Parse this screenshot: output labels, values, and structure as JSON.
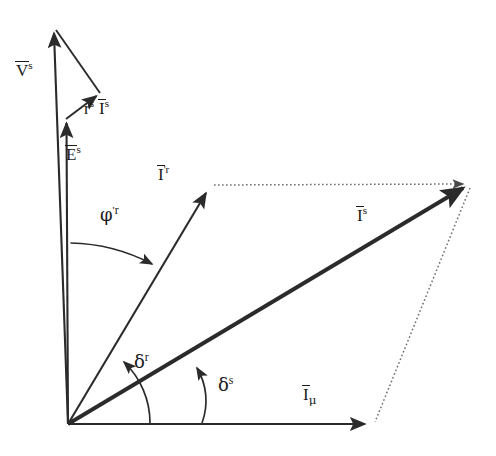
{
  "figure": {
    "kind": "phasor-diagram",
    "background_color": "#ffffff",
    "line_color": "#2b2b2b",
    "dotted_color": "#6e6e6e",
    "origin": {
      "x": 68,
      "y": 424
    }
  },
  "labels": {
    "v_s": {
      "base": "V",
      "overbar": true,
      "sup": "s",
      "text": "V̄ˢ",
      "x": 16,
      "y": 62
    },
    "rs_is": {
      "base": "r",
      "sup1": "s",
      "base2": "I",
      "overbar2": true,
      "sup2": "s",
      "text": "rˢ Īˢ",
      "x": 84,
      "y": 100
    },
    "e_s": {
      "base": "E",
      "overbar": true,
      "sup": "s",
      "text": "Ēˢ",
      "x": 66,
      "y": 146
    },
    "i_pr_r": {
      "base": "I",
      "overbar": true,
      "prime": "'",
      "sup": "r",
      "text": "Ī'ʳ",
      "x": 158,
      "y": 166
    },
    "i_s": {
      "base": "I",
      "overbar": true,
      "sup": "s",
      "text": "Īˢ",
      "x": 357,
      "y": 207
    },
    "i_mu": {
      "base": "I",
      "overbar": true,
      "sub": "μ",
      "text": "Īᵥ",
      "x": 303,
      "y": 386
    },
    "phi_pr_r": {
      "base": "φ",
      "prime": "'",
      "sup": "r",
      "text": "φ'ʳ",
      "x": 100,
      "y": 206
    },
    "delta_r": {
      "base": "δ",
      "sup": "r",
      "text": "δʳ",
      "x": 134,
      "y": 353
    },
    "delta_s": {
      "base": "δ",
      "sup": "s",
      "text": "δˢ",
      "x": 218,
      "y": 376
    }
  },
  "vectors": [
    {
      "name": "v-s-vector",
      "label_key": "v_s",
      "style": "solid",
      "from": {
        "x": 68,
        "y": 424
      },
      "to": {
        "x": 53,
        "y": 25
      }
    },
    {
      "name": "e-s-vector",
      "label_key": "e_s",
      "style": "solid",
      "from": {
        "x": 68,
        "y": 424
      },
      "to": {
        "x": 66,
        "y": 116
      }
    },
    {
      "name": "rs-is-vector",
      "label_key": "rs_is",
      "style": "solid",
      "from": {
        "x": 66,
        "y": 119
      },
      "to": {
        "x": 99,
        "y": 93
      }
    },
    {
      "name": "v-s-closing-line",
      "label_key": null,
      "style": "solid-no-head",
      "from": {
        "x": 54,
        "y": 31
      },
      "to": {
        "x": 99,
        "y": 93
      }
    },
    {
      "name": "i-prime-r-vector",
      "label_key": "i_pr_r",
      "style": "solid",
      "from": {
        "x": 68,
        "y": 424
      },
      "to": {
        "x": 211,
        "y": 185
      }
    },
    {
      "name": "i-s-vector",
      "label_key": "i_s",
      "style": "solid-thick",
      "from": {
        "x": 68,
        "y": 424
      },
      "to": {
        "x": 470,
        "y": 184
      }
    },
    {
      "name": "i-mu-vector",
      "label_key": "i_mu",
      "style": "solid",
      "from": {
        "x": 68,
        "y": 424
      },
      "to": {
        "x": 372,
        "y": 424
      }
    },
    {
      "name": "construction-line-top",
      "label_key": null,
      "style": "dotted",
      "from": {
        "x": 212,
        "y": 185
      },
      "to": {
        "x": 470,
        "y": 184
      }
    },
    {
      "name": "construction-line-right",
      "label_key": null,
      "style": "dotted",
      "from": {
        "x": 470,
        "y": 185
      },
      "to": {
        "x": 373,
        "y": 424
      }
    }
  ],
  "angle_arcs": [
    {
      "name": "phi-prime-r-arc",
      "label_key": "phi_pr_r",
      "from_ref": "vertical-axis",
      "to_ref": "i-prime-r-vector",
      "start": {
        "x": 71,
        "y": 242
      },
      "end": {
        "x": 157,
        "y": 266
      },
      "sweep_deg": 49
    },
    {
      "name": "delta-r-arc",
      "label_key": "delta_r",
      "from_ref": "horizontal-axis",
      "to_ref": "i-prime-r-vector",
      "start": {
        "x": 150,
        "y": 423
      },
      "end": {
        "x": 120,
        "y": 357
      },
      "sweep_deg": 59
    },
    {
      "name": "delta-s-arc",
      "label_key": "delta_s",
      "from_ref": "horizontal-axis",
      "to_ref": "i-s-vector",
      "start": {
        "x": 202,
        "y": 423
      },
      "end": {
        "x": 197,
        "y": 362
      },
      "sweep_deg": 31
    }
  ]
}
